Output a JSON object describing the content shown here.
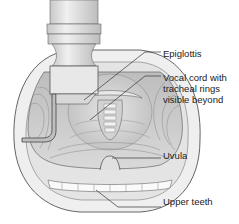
{
  "figure": {
    "labels": [
      {
        "id": "epiglottis",
        "text": "Epiglottis"
      },
      {
        "id": "vocal-cord",
        "lines": [
          "Vocal cord with",
          "tracheal rings",
          "visible beyond"
        ]
      },
      {
        "id": "uvula",
        "text": "Uvula"
      },
      {
        "id": "upper-teeth",
        "text": "Upper teeth"
      }
    ]
  }
}
